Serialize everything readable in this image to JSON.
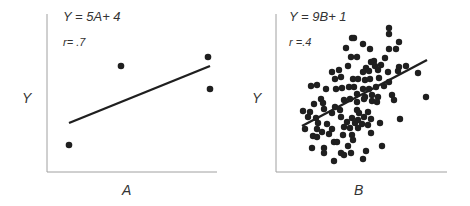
{
  "chart_data": [
    {
      "id": "A",
      "type": "scatter",
      "title": "",
      "equation": "Y = 5A+ 4",
      "correlation": "r= .7",
      "xlabel": "A",
      "ylabel": "Y",
      "grid": false,
      "ticks": false,
      "frame": {
        "x0": 47,
        "y0": 14,
        "x1": 217,
        "y1": 172
      },
      "regression_line": {
        "x1": 69,
        "y1": 123,
        "x2": 210,
        "y2": 66
      },
      "points_px": [
        [
          69,
          145
        ],
        [
          121,
          66
        ],
        [
          208,
          57
        ],
        [
          210,
          89
        ]
      ],
      "n_points": 4
    },
    {
      "id": "B",
      "type": "scatter",
      "title": "",
      "equation": "Y = 9B+ 1",
      "correlation": "r =.4",
      "xlabel": "B",
      "ylabel": "Y",
      "grid": false,
      "ticks": false,
      "frame": {
        "x0": 276,
        "y0": 14,
        "x1": 447,
        "y1": 172
      },
      "regression_line": {
        "x1": 302,
        "y1": 126,
        "x2": 427,
        "y2": 60
      },
      "points_px": [
        [
          389,
          28
        ],
        [
          389,
          34
        ],
        [
          352,
          38
        ],
        [
          354,
          38
        ],
        [
          363,
          44
        ],
        [
          399,
          42
        ],
        [
          389,
          49
        ],
        [
          396,
          49
        ],
        [
          346,
          48
        ],
        [
          370,
          49
        ],
        [
          351,
          57
        ],
        [
          357,
          57
        ],
        [
          385,
          58
        ],
        [
          374,
          61
        ],
        [
          371,
          62
        ],
        [
          348,
          66
        ],
        [
          366,
          68
        ],
        [
          375,
          66
        ],
        [
          381,
          65
        ],
        [
          399,
          67
        ],
        [
          406,
          66
        ],
        [
          398,
          71
        ],
        [
          418,
          73
        ],
        [
          332,
          72
        ],
        [
          339,
          70
        ],
        [
          363,
          72
        ],
        [
          369,
          71
        ],
        [
          378,
          70
        ],
        [
          388,
          72
        ],
        [
          341,
          77
        ],
        [
          335,
          79
        ],
        [
          353,
          79
        ],
        [
          358,
          79
        ],
        [
          365,
          80
        ],
        [
          370,
          79
        ],
        [
          379,
          78
        ],
        [
          389,
          82
        ],
        [
          311,
          86
        ],
        [
          317,
          85
        ],
        [
          326,
          89
        ],
        [
          336,
          89
        ],
        [
          342,
          88
        ],
        [
          349,
          87
        ],
        [
          354,
          87
        ],
        [
          363,
          89
        ],
        [
          369,
          89
        ],
        [
          376,
          87
        ],
        [
          384,
          86
        ],
        [
          357,
          94
        ],
        [
          365,
          97
        ],
        [
          372,
          95
        ],
        [
          378,
          97
        ],
        [
          392,
          95
        ],
        [
          426,
          97
        ],
        [
          321,
          99
        ],
        [
          344,
          100
        ],
        [
          350,
          99
        ],
        [
          357,
          102
        ],
        [
          364,
          99
        ],
        [
          372,
          101
        ],
        [
          377,
          102
        ],
        [
          394,
          100
        ],
        [
          314,
          104
        ],
        [
          323,
          103
        ],
        [
          324,
          109
        ],
        [
          335,
          107
        ],
        [
          340,
          110
        ],
        [
          303,
          111
        ],
        [
          310,
          112
        ],
        [
          332,
          113
        ],
        [
          357,
          110
        ],
        [
          359,
          113
        ],
        [
          368,
          112
        ],
        [
          308,
          117
        ],
        [
          316,
          118
        ],
        [
          341,
          117
        ],
        [
          352,
          118
        ],
        [
          358,
          120
        ],
        [
          364,
          117
        ],
        [
          371,
          119
        ],
        [
          400,
          119
        ],
        [
          305,
          129
        ],
        [
          318,
          123
        ],
        [
          327,
          124
        ],
        [
          347,
          122
        ],
        [
          355,
          123
        ],
        [
          362,
          124
        ],
        [
          368,
          125
        ],
        [
          380,
          123
        ],
        [
          317,
          129
        ],
        [
          322,
          132
        ],
        [
          332,
          129
        ],
        [
          344,
          127
        ],
        [
          350,
          128
        ],
        [
          358,
          128
        ],
        [
          313,
          136
        ],
        [
          329,
          134
        ],
        [
          343,
          135
        ],
        [
          352,
          135
        ],
        [
          371,
          133
        ],
        [
          317,
          137
        ],
        [
          334,
          142
        ],
        [
          337,
          142
        ],
        [
          353,
          140
        ],
        [
          348,
          146
        ],
        [
          312,
          148
        ],
        [
          324,
          148
        ],
        [
          382,
          146
        ],
        [
          324,
          153
        ],
        [
          341,
          153
        ],
        [
          344,
          155
        ],
        [
          351,
          153
        ],
        [
          366,
          151
        ],
        [
          334,
          161
        ],
        [
          363,
          159
        ]
      ],
      "n_points": 115
    }
  ],
  "colors": {
    "ink": "#1f1f1f",
    "axis": "#9a9a9a",
    "text": "#333333"
  }
}
